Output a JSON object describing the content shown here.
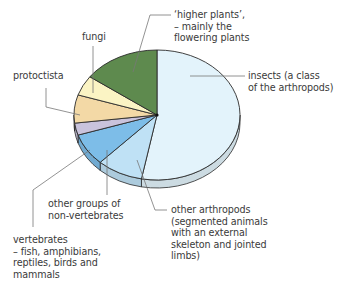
{
  "chart_data": {
    "type": "pie",
    "title": "",
    "style": "3d-tilted",
    "slices": [
      {
        "label": "insects (a class of the arthropods)",
        "value": 53,
        "color": "#e3f3fb"
      },
      {
        "label": "other arthropods (segmented animals with an external skeleton and jointed limbs)",
        "value": 9,
        "color": "#bfe1f5"
      },
      {
        "label": "other groups of non-vertebrates",
        "value": 8,
        "color": "#7dbde8"
      },
      {
        "label": "vertebrates – fish, amphibians, reptiles, birds and mammals",
        "value": 3,
        "color": "#c9c3dc"
      },
      {
        "label": "protoctista",
        "value": 7,
        "color": "#f3d9a6"
      },
      {
        "label": "fungi",
        "value": 5,
        "color": "#fbf4c4"
      },
      {
        "label": "'higher plants', – mainly the flowering plants",
        "value": 15,
        "color": "#5e8a4e"
      }
    ],
    "legend": "callout labels with leader lines"
  },
  "labels": {
    "higher_plants": "‘higher plants’,\n– mainly the\nflowering plants",
    "fungi": "fungi",
    "protoctista": "protoctista",
    "insects": "insects (a class\nof the arthropods)",
    "other_groups": "other groups of\nnon-vertebrates",
    "vertebrates": "vertebrates\n– fish, amphibians,\nreptiles, birds and\nmammals",
    "other_arthropods": "other arthropods\n(segmented animals\nwith an external\nskeleton and jointed\nlimbs)"
  }
}
